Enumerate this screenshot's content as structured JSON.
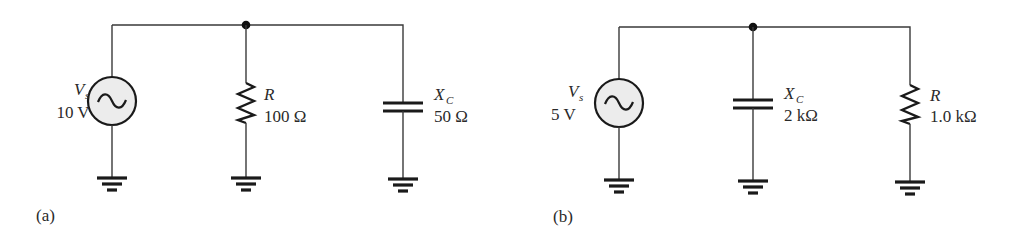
{
  "figure": {
    "panels": [
      {
        "id": "a",
        "caption": "(a)",
        "source": {
          "symbol": "V",
          "subscript": "s",
          "value": "10 V",
          "type": "ac-voltage-source"
        },
        "branch1": {
          "symbol": "R",
          "subscript": "",
          "value": "100 Ω",
          "type": "resistor"
        },
        "branch2": {
          "symbol": "X",
          "subscript": "C",
          "value": "50 Ω",
          "type": "capacitor"
        }
      },
      {
        "id": "b",
        "caption": "(b)",
        "source": {
          "symbol": "V",
          "subscript": "s",
          "value": "5 V",
          "type": "ac-voltage-source"
        },
        "branch1": {
          "symbol": "X",
          "subscript": "C",
          "value": "2 kΩ",
          "type": "capacitor"
        },
        "branch2": {
          "symbol": "R",
          "subscript": "",
          "value": "1.0 kΩ",
          "type": "resistor"
        }
      }
    ]
  },
  "colors": {
    "wire": "#3a3a3a",
    "component": "#1a1a1a",
    "source_fill": "#ececec",
    "text": "#2a2a2a"
  }
}
